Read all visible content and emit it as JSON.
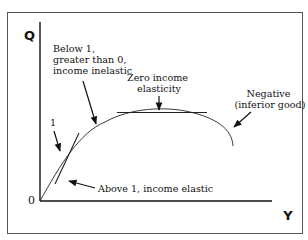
{
  "diagram": {
    "axes": {
      "y_label": "Q",
      "x_label": "Y",
      "origin_label": "0"
    },
    "annotations": {
      "unit_tangent": "1",
      "below_one": [
        "Below 1,",
        "greater than 0,",
        "income inelastic"
      ],
      "zero": [
        "Zero income",
        "elasticity"
      ],
      "negative": [
        "Negative",
        "(inferior good)"
      ],
      "above_one": "Above 1, income elastic"
    },
    "colors": {
      "ink": "#111111",
      "frame": "#555555",
      "background": "#ffffff"
    }
  }
}
